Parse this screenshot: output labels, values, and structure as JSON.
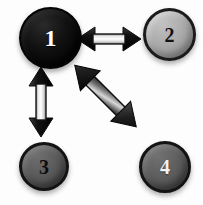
{
  "diagram": {
    "background_color": "#fdfdfd",
    "nodes": [
      {
        "id": "1",
        "label": "1",
        "fill_color": "#000000",
        "label_color": "#ffffff",
        "outline_color": "#050505",
        "position": "top-left",
        "diameter_px": 62
      },
      {
        "id": "2",
        "label": "2",
        "fill_color": "#ababab",
        "label_color": "#121212",
        "outline_color": "#1b1b1b",
        "position": "top-right",
        "diameter_px": 53
      },
      {
        "id": "3",
        "label": "3",
        "fill_color": "#5b5b5b",
        "label_color": "#0d0d0d",
        "outline_color": "#131313",
        "position": "bottom-left",
        "diameter_px": 49
      },
      {
        "id": "4",
        "label": "4",
        "fill_color": "#5e5e5e",
        "label_color": "#f2f2f2",
        "outline_color": "#131313",
        "position": "bottom-right",
        "diameter_px": 52
      }
    ],
    "connections": [
      {
        "id": "1-2",
        "from": "1",
        "to": "2",
        "style": "double-headed-arrow",
        "orientation": "horizontal",
        "fill": "light-gradient",
        "outline_color": "#1a1a1a"
      },
      {
        "id": "1-3",
        "from": "1",
        "to": "3",
        "style": "double-headed-arrow",
        "orientation": "vertical",
        "fill": "light-gradient",
        "outline_color": "#1a1a1a"
      },
      {
        "id": "1-4",
        "from": "1",
        "to": "4",
        "style": "double-headed-arrow",
        "orientation": "diagonal",
        "fill": "dark-gradient",
        "outline_color": "#101010"
      }
    ]
  }
}
